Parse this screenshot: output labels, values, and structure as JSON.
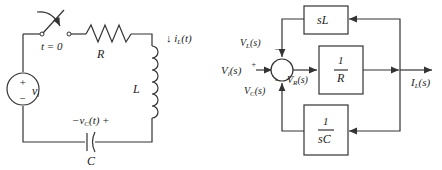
{
  "circuit": {
    "switch_label": "t = 0",
    "resistor_label": "R",
    "inductor_label": "L",
    "capacitor_label": "C",
    "source_label": "v",
    "source_sub": "i",
    "source_plus": "+",
    "source_minus": "−",
    "current_label": "↓ i",
    "current_sub": "L",
    "current_arg": "(t)",
    "cap_voltage_prefix": "−v",
    "cap_voltage_sub": "C",
    "cap_voltage_suffix": "(t) +"
  },
  "block_diagram": {
    "input_label": "V",
    "input_sub": "i",
    "input_arg": "(s)",
    "sum_plus": "+",
    "sum_minus_top": "−",
    "sum_minus_bottom": "−",
    "vl_label": "V",
    "vl_sub": "L",
    "vl_arg": "(s)",
    "vc_label": "V",
    "vc_sub": "C",
    "vc_arg": "(s)",
    "vr_label": "V",
    "vr_sub": "R",
    "vr_arg": "(s)",
    "block_sl": "sL",
    "block_r_num": "1",
    "block_r_den": "R",
    "block_sc_num": "1",
    "block_sc_den": "sC",
    "output_label": "I",
    "output_sub": "L",
    "output_arg": "(s)"
  }
}
